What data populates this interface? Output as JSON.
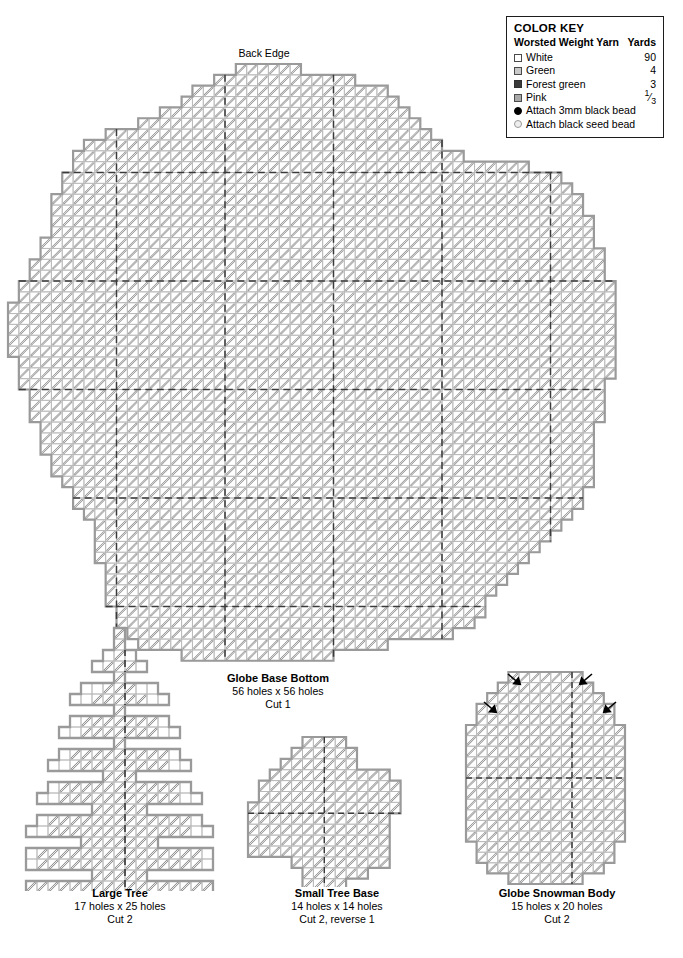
{
  "document": {
    "type": "plastic-canvas-pattern",
    "back_edge_label": "Back Edge"
  },
  "color_key": {
    "title": "COLOR KEY",
    "header_left": "Worsted Weight Yarn",
    "header_right": "Yards",
    "rows": [
      {
        "icon": "swatch",
        "color": "#ffffff",
        "label": "White",
        "yards": "90"
      },
      {
        "icon": "swatch",
        "color": "#c9c9c9",
        "label": "Green",
        "yards": "4"
      },
      {
        "icon": "swatch",
        "color": "#3a3a3a",
        "label": "Forest green",
        "yards": "3"
      },
      {
        "icon": "swatch",
        "color": "#a8a8a8",
        "label": "Pink",
        "yards": "1/3"
      },
      {
        "icon": "bead-solid",
        "color": "#000000",
        "label": "Attach 3mm black bead",
        "yards": ""
      },
      {
        "icon": "bead-seed",
        "color": "#eeeeee",
        "label": "Attach black seed bead",
        "yards": ""
      }
    ]
  },
  "pieces": [
    {
      "id": "globe-base-bottom",
      "title": "Globe Base Bottom",
      "size": "56 holes x 56 holes",
      "cut": "Cut 1"
    },
    {
      "id": "large-tree",
      "title": "Large Tree",
      "size": "17 holes x 25 holes",
      "cut": "Cut 2"
    },
    {
      "id": "small-tree-base",
      "title": "Small Tree Base",
      "size": "14 holes x 14 holes",
      "cut": "Cut 2, reverse 1"
    },
    {
      "id": "globe-snowman-body",
      "title": "Globe Snowman Body",
      "size": "15 holes x 20 holes",
      "cut": "Cut 2"
    }
  ],
  "colors": {
    "grid_line": "#b4b4b4",
    "outline": "#9a9a9a",
    "stitch": "#8c8c8c",
    "guide_line": "#3a3a3a",
    "text": "#000000",
    "page_background": "#ffffff"
  }
}
